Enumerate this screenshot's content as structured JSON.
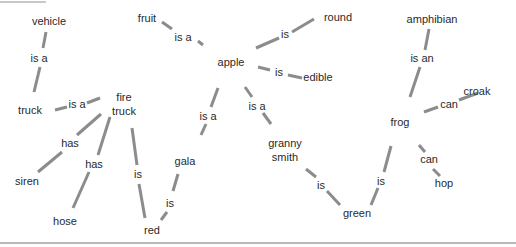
{
  "diagram": {
    "type": "semantic-network",
    "colors": {
      "edge": "#8c8c8c",
      "text": "#2a2a2a",
      "background": "#ffffff",
      "rule": "#b9b9b9"
    },
    "nodes": [
      {
        "id": "vehicle",
        "lines": [
          "vehicle"
        ],
        "x": 49,
        "y": 25
      },
      {
        "id": "truck",
        "lines": [
          "truck"
        ],
        "x": 30,
        "y": 114
      },
      {
        "id": "fire_truck",
        "lines": [
          "fire",
          "truck"
        ],
        "x": 124,
        "y": 101
      },
      {
        "id": "siren",
        "lines": [
          "siren"
        ],
        "x": 27,
        "y": 185
      },
      {
        "id": "hose",
        "lines": [
          "hose"
        ],
        "x": 65,
        "y": 225
      },
      {
        "id": "red",
        "lines": [
          "red"
        ],
        "x": 152,
        "y": 234
      },
      {
        "id": "fruit",
        "lines": [
          "fruit"
        ],
        "x": 147,
        "y": 22
      },
      {
        "id": "apple",
        "lines": [
          "apple"
        ],
        "x": 231,
        "y": 66
      },
      {
        "id": "round",
        "lines": [
          "round"
        ],
        "x": 338,
        "y": 21
      },
      {
        "id": "edible",
        "lines": [
          "edible"
        ],
        "x": 318,
        "y": 81
      },
      {
        "id": "gala",
        "lines": [
          "gala"
        ],
        "x": 185,
        "y": 165
      },
      {
        "id": "granny_smith",
        "lines": [
          "granny",
          "smith"
        ],
        "x": 285,
        "y": 147
      },
      {
        "id": "green",
        "lines": [
          "green"
        ],
        "x": 357,
        "y": 217
      },
      {
        "id": "amphibian",
        "lines": [
          "amphibian"
        ],
        "x": 432,
        "y": 23
      },
      {
        "id": "frog",
        "lines": [
          "frog"
        ],
        "x": 400,
        "y": 126
      },
      {
        "id": "croak",
        "lines": [
          "croak"
        ],
        "x": 477,
        "y": 95
      },
      {
        "id": "hop",
        "lines": [
          "hop"
        ],
        "x": 444,
        "y": 187
      }
    ],
    "edges": [
      {
        "from": "truck",
        "to": "vehicle",
        "label": "is a",
        "lx": 39,
        "ly": 62,
        "segments": [
          [
            46,
            32,
            43,
            48
          ],
          [
            40,
            67,
            34,
            92
          ]
        ]
      },
      {
        "from": "fire_truck",
        "to": "truck",
        "label": "is a",
        "lx": 77,
        "ly": 108,
        "segments": [
          [
            55,
            110,
            67,
            107
          ],
          [
            87,
            103,
            100,
            98
          ]
        ]
      },
      {
        "from": "fire_truck",
        "to": "siren",
        "label": "has",
        "lx": 70,
        "ly": 147,
        "segments": [
          [
            101,
            114,
            77,
            135
          ],
          [
            62,
            152,
            38,
            172
          ]
        ]
      },
      {
        "from": "fire_truck",
        "to": "hose",
        "label": "has",
        "lx": 94,
        "ly": 168,
        "segments": [
          [
            110,
            117,
            98,
            155
          ],
          [
            89,
            172,
            73,
            208
          ]
        ]
      },
      {
        "from": "fire_truck",
        "to": "red",
        "label": "is",
        "lx": 138,
        "ly": 178,
        "segments": [
          [
            132,
            128,
            137,
            165
          ],
          [
            139,
            184,
            145,
            218
          ]
        ]
      },
      {
        "from": "gala",
        "to": "red",
        "label": "is",
        "lx": 170,
        "ly": 207,
        "segments": [
          [
            178,
            174,
            173,
            191
          ],
          [
            167,
            212,
            161,
            220
          ]
        ]
      },
      {
        "from": "apple",
        "to": "fruit",
        "label": "is a",
        "lx": 183,
        "ly": 41,
        "segments": [
          [
            162,
            22,
            172,
            29
          ],
          [
            198,
            41,
            203,
            45
          ]
        ]
      },
      {
        "from": "apple",
        "to": "round",
        "label": "is",
        "lx": 285,
        "ly": 38,
        "segments": [
          [
            256,
            48,
            279,
            38
          ],
          [
            292,
            32,
            314,
            19
          ]
        ]
      },
      {
        "from": "apple",
        "to": "edible",
        "label": "is",
        "lx": 279,
        "ly": 76,
        "segments": [
          [
            258,
            67,
            270,
            70
          ],
          [
            288,
            75,
            302,
            78
          ]
        ]
      },
      {
        "from": "gala",
        "to": "apple",
        "label": "is a",
        "lx": 208,
        "ly": 120,
        "segments": [
          [
            218,
            88,
            211,
            107
          ],
          [
            206,
            124,
            201,
            135
          ]
        ]
      },
      {
        "from": "granny_smith",
        "to": "apple",
        "label": "is a",
        "lx": 257,
        "ly": 110,
        "segments": [
          [
            245,
            87,
            252,
            97
          ],
          [
            263,
            113,
            271,
            124
          ]
        ]
      },
      {
        "from": "granny_smith",
        "to": "green",
        "label": "is",
        "lx": 321,
        "ly": 189,
        "segments": [
          [
            306,
            169,
            316,
            177
          ],
          [
            327,
            191,
            340,
            205
          ]
        ]
      },
      {
        "from": "frog",
        "to": "green",
        "label": "is",
        "lx": 381,
        "ly": 185,
        "segments": [
          [
            391,
            146,
            384,
            172
          ],
          [
            378,
            188,
            371,
            205
          ]
        ]
      },
      {
        "from": "frog",
        "to": "amphibian",
        "label": "is an",
        "lx": 422,
        "ly": 62,
        "segments": [
          [
            429,
            29,
            425,
            50
          ],
          [
            420,
            67,
            410,
            97
          ]
        ]
      },
      {
        "from": "frog",
        "to": "croak",
        "label": "can",
        "lx": 449,
        "ly": 108,
        "segments": [
          [
            424,
            112,
            438,
            107
          ],
          [
            459,
            100,
            478,
            93
          ]
        ]
      },
      {
        "from": "frog",
        "to": "hop",
        "label": "can",
        "lx": 429,
        "ly": 163,
        "segments": [
          [
            419,
            145,
            425,
            152
          ],
          [
            433,
            169,
            440,
            176
          ]
        ]
      }
    ]
  }
}
